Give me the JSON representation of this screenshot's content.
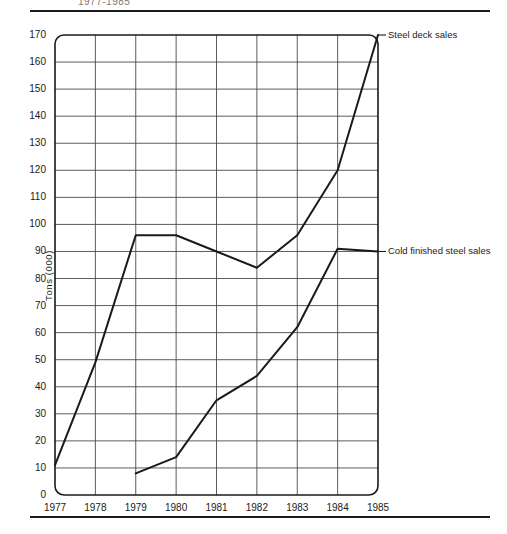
{
  "header": {
    "title": "1977-1985"
  },
  "chart_data": {
    "type": "line",
    "title": "1977-1985",
    "xlabel": "",
    "ylabel": "Tons (000)",
    "categories": [
      "1977",
      "1978",
      "1979",
      "1980",
      "1981",
      "1982",
      "1983",
      "1984",
      "1985"
    ],
    "x_tick_labels": [
      "1977",
      "1978",
      "1979",
      "1980",
      "1981",
      "1982",
      "1983",
      "1984",
      "1985"
    ],
    "y_tick_labels": [
      "0",
      "10",
      "20",
      "30",
      "40",
      "50",
      "60",
      "70",
      "80",
      "90",
      "100",
      "110",
      "120",
      "130",
      "140",
      "150",
      "160",
      "170"
    ],
    "ylim": [
      0,
      170
    ],
    "y_tick_step": 10,
    "grid": true,
    "legend_position": "right-inline",
    "series": [
      {
        "name": "Steel deck sales",
        "label": "Steel deck sales",
        "color": "#1a1a1a",
        "x": [
          "1977",
          "1978",
          "1979",
          "1980",
          "1981",
          "1982",
          "1983",
          "1984",
          "1985"
        ],
        "values": [
          11,
          49,
          96,
          96,
          90,
          84,
          96,
          120,
          170
        ]
      },
      {
        "name": "Cold finished steel sales",
        "label": "Cold finished steel sales",
        "color": "#1a1a1a",
        "x": [
          "1979",
          "1980",
          "1981",
          "1982",
          "1983",
          "1984",
          "1985"
        ],
        "values": [
          8,
          14,
          35,
          44,
          62,
          91,
          90
        ]
      }
    ]
  },
  "colors": {
    "line": "#1a1a1a",
    "grid": "#4a4a4a",
    "frame": "#1a1a1a",
    "background": "#ffffff"
  }
}
